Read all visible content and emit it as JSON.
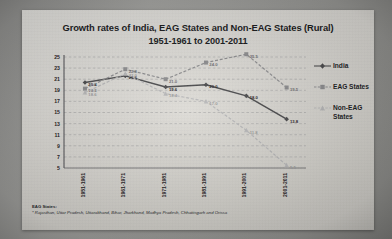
{
  "slide": {
    "title_line1": "Growth rates of India, EAG States and Non-EAG States  (Rural)",
    "title_line2": "1951-1961 to 2001-2011"
  },
  "footnote": {
    "head": "EAG States:",
    "body": "* Rajasthan, Uttar Pradesh, Uttarakhand, Bihar, Jharkhand, Madhya Pradesh, Chhattisgarh and Orissa"
  },
  "legend": {
    "position": "right",
    "items": [
      {
        "label": "India",
        "color": "#4b4b4d",
        "marker": "diamond"
      },
      {
        "label": "EAG States",
        "color": "#8e8e90",
        "marker": "square"
      },
      {
        "label": "Non-EAG States",
        "color": "#b9b9ba",
        "marker": "triangle"
      }
    ]
  },
  "chart_data": {
    "type": "line",
    "title": "Growth rates of India, EAG States and Non-EAG States (Rural) 1951-1961 to 2001-2011",
    "xlabel": "",
    "ylabel": "",
    "ylim": [
      5,
      25
    ],
    "ytick_step": 2,
    "grid": true,
    "yticks": [
      25,
      23,
      21,
      19,
      17,
      15,
      13,
      11,
      9,
      7,
      5
    ],
    "categories": [
      "1951-1961",
      "1961-1971",
      "1971-1981",
      "1981-1991",
      "1991-2001",
      "2001-2011"
    ],
    "series": [
      {
        "name": "India",
        "color": "#4b4b4d",
        "values": [
          20.4,
          21.6,
          19.6,
          20.0,
          18.0,
          13.8
        ],
        "labels": [
          "20.4",
          "21.6",
          "19.6",
          "20.0",
          "18.0",
          "13.8"
        ]
      },
      {
        "name": "EAG States",
        "color": "#8e8e90",
        "values": [
          19.3,
          22.8,
          21.0,
          24.0,
          25.5,
          19.5
        ],
        "labels": [
          "19.3",
          "22.8",
          "21.0",
          "24.0",
          "25.5",
          "19.5"
        ]
      },
      {
        "name": "Non-EAG States",
        "color": "#b9b9ba",
        "values": [
          18.6,
          22.0,
          18.4,
          17.0,
          11.8,
          5.5
        ],
        "labels": [
          "18.6",
          "22.0",
          "18.4",
          "17.0",
          "11.8",
          "5.5"
        ]
      }
    ]
  }
}
